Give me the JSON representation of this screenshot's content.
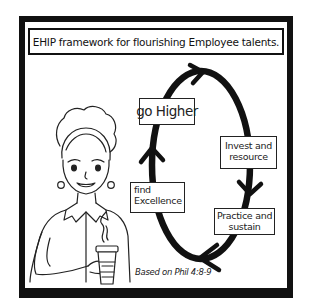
{
  "title": "EHIP framework for flourishing Employee talents.",
  "cycle": {
    "direction": "clockwise",
    "steps": [
      {
        "id": "higher",
        "label": "go Higher"
      },
      {
        "id": "invest",
        "line1": "Invest and",
        "line2": "resource"
      },
      {
        "id": "practice",
        "line1": "Practice and",
        "line2": "sustain"
      },
      {
        "id": "find",
        "line1": "find",
        "line2": "Excellence"
      }
    ]
  },
  "caption": "Based on Phil 4:8-9",
  "illustration": {
    "subject": "woman holding a steaming coffee cup",
    "icons": [
      "woman-figure",
      "coffee-cup-icon",
      "steam-icon"
    ]
  },
  "colors": {
    "stroke": "#111111",
    "background": "#ffffff"
  }
}
